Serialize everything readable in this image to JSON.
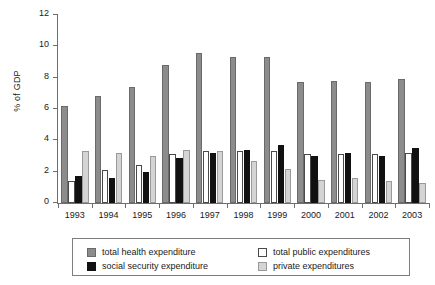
{
  "chart_data": {
    "type": "bar",
    "title": "",
    "xlabel": "",
    "ylabel": "% of GDP",
    "ylim": [
      0,
      12
    ],
    "yticks": [
      0,
      2,
      4,
      6,
      8,
      10,
      12
    ],
    "grid": false,
    "legend_position": "bottom",
    "categories": [
      "1993",
      "1994",
      "1995",
      "1996",
      "1997",
      "1998",
      "1999",
      "2000",
      "2001",
      "2002",
      "2003"
    ],
    "series": [
      {
        "name": "total health expenditure",
        "color": "#8c8c8c",
        "values": [
          6.2,
          6.8,
          7.4,
          8.8,
          9.6,
          9.3,
          9.3,
          7.7,
          7.8,
          7.7,
          7.9
        ]
      },
      {
        "name": "total public expenditures",
        "color": "#ffffff",
        "values": [
          1.4,
          2.1,
          2.4,
          3.1,
          3.3,
          3.3,
          3.3,
          3.1,
          3.1,
          3.1,
          3.2
        ]
      },
      {
        "name": "social security expenditure",
        "color": "#111111",
        "values": [
          1.7,
          1.6,
          2.0,
          2.9,
          3.2,
          3.4,
          3.7,
          3.0,
          3.2,
          3.0,
          3.5
        ]
      },
      {
        "name": "private expenditures",
        "color": "#d4d4d4",
        "values": [
          3.3,
          3.2,
          3.0,
          3.4,
          3.3,
          2.7,
          2.2,
          1.5,
          1.6,
          1.4,
          1.3
        ]
      }
    ]
  },
  "legend": {
    "entries": [
      {
        "label": "total health expenditure",
        "swatch": "s-total"
      },
      {
        "label": "social security expenditure",
        "swatch": "s-social"
      },
      {
        "label": "total public expenditures",
        "swatch": "s-public"
      },
      {
        "label": "private expenditures",
        "swatch": "s-private"
      }
    ]
  }
}
